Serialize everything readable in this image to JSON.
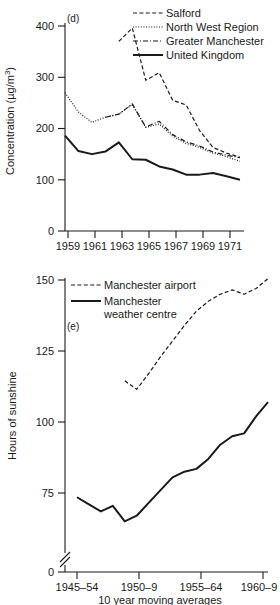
{
  "figure": {
    "panels": [
      "d",
      "e"
    ]
  },
  "chart_data": [
    {
      "type": "line",
      "panel_label": "(d)",
      "title": "",
      "xlabel": "",
      "ylabel": "Concentration (µg/m³)",
      "ylabel_parts": {
        "main": "Concentration (µg/m",
        "sup": "3",
        "tail": ")"
      },
      "xlim": [
        1958,
        1971
      ],
      "ylim": [
        0,
        420
      ],
      "yticks": [
        0,
        100,
        200,
        300,
        400
      ],
      "ytick_labels": [
        "0",
        "100",
        "200",
        "300",
        "400"
      ],
      "xticks": [
        1959,
        1961,
        1963,
        1965,
        1967,
        1969,
        1971
      ],
      "xtick_labels": [
        "1959",
        "1961",
        "1963",
        "1965",
        "1967",
        "1969",
        "1971"
      ],
      "grid": false,
      "legend_position": "top-right",
      "series": [
        {
          "name": "Salford",
          "style": "dashed",
          "x": [
            1962,
            1963,
            1964,
            1965,
            1966,
            1967,
            1968,
            1969,
            1970,
            1971
          ],
          "values": [
            370,
            396,
            294,
            309,
            255,
            246,
            196,
            163,
            152,
            144
          ]
        },
        {
          "name": "North West Region",
          "style": "dotted",
          "x": [
            1958,
            1959,
            1960,
            1961,
            1962,
            1963,
            1964,
            1965,
            1966,
            1967,
            1968,
            1969,
            1970,
            1971
          ],
          "values": [
            270,
            232,
            212,
            222,
            228,
            247,
            202,
            209,
            185,
            171,
            163,
            152,
            145,
            136
          ]
        },
        {
          "name": "Greater Manchester",
          "style": "dash-dot",
          "x": [
            1961,
            1962,
            1963,
            1964,
            1965,
            1966,
            1967,
            1968,
            1969,
            1970,
            1971
          ],
          "values": [
            222,
            228,
            248,
            203,
            214,
            188,
            174,
            166,
            154,
            148,
            143
          ]
        },
        {
          "name": "United Kingdom",
          "style": "solid",
          "x": [
            1958,
            1959,
            1960,
            1961,
            1962,
            1963,
            1964,
            1965,
            1966,
            1967,
            1968,
            1969,
            1970,
            1971
          ],
          "values": [
            186,
            156,
            150,
            155,
            173,
            140,
            139,
            126,
            120,
            110,
            110,
            113,
            107,
            100
          ]
        }
      ]
    },
    {
      "type": "line",
      "panel_label": "(e)",
      "title": "",
      "xlabel": "10 year moving averages",
      "ylabel": "Hours of sunshine",
      "ylim": [
        0,
        152
      ],
      "yticks": [
        0,
        75,
        100,
        125,
        150
      ],
      "ytick_labels": [
        "0",
        "75",
        "100",
        "125",
        "150"
      ],
      "axis_break": true,
      "xtick_labels": [
        "1945–54",
        "1950–9",
        "1955–64",
        "1960–9"
      ],
      "xticks": [
        0,
        5,
        10,
        15
      ],
      "xlim": [
        0,
        16
      ],
      "grid": false,
      "legend_position": "top-left",
      "series": [
        {
          "name": "Manchester airport",
          "style": "dashed",
          "x": [
            4,
            5,
            6,
            7,
            8,
            9,
            10,
            11,
            12,
            13,
            14,
            15,
            16
          ],
          "values": [
            114.5,
            111.5,
            117,
            123,
            128.5,
            134,
            139,
            142.5,
            145,
            146.5,
            145,
            147,
            150.5
          ]
        },
        {
          "name": "Manchester weather centre",
          "style": "solid",
          "x": [
            0,
            1,
            2,
            3,
            4,
            5,
            6,
            7,
            8,
            9,
            10,
            11,
            12,
            13,
            14,
            15,
            16
          ],
          "values": [
            73.5,
            71,
            68.5,
            70.5,
            65,
            67,
            71.5,
            76,
            80.5,
            82.5,
            83.5,
            87,
            92,
            95,
            96,
            102,
            107
          ]
        }
      ]
    }
  ],
  "panel_d": {
    "panel_label": "(d)",
    "y_axis_title_main": "Concentration (µg/m",
    "y_axis_title_sup": "3",
    "y_axis_title_tail": ")",
    "legend": [
      {
        "label": "Salford",
        "style": "dashed"
      },
      {
        "label": "North West Region",
        "style": "dotted"
      },
      {
        "label": "Greater Manchester",
        "style": "dash-dot"
      },
      {
        "label": "United Kingdom",
        "style": "solid"
      }
    ]
  },
  "panel_e": {
    "panel_label": "(e)",
    "y_axis_title": "Hours of sunshine",
    "x_axis_title": "10 year moving averages",
    "legend": [
      {
        "label": "Manchester airport",
        "style": "dashed"
      },
      {
        "label_line1": "Manchester",
        "label_line2": "weather centre",
        "style": "solid"
      }
    ]
  },
  "colors": {
    "ink": "#1a1a1a",
    "background": "#ffffff"
  }
}
